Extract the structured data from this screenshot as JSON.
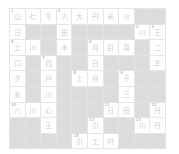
{
  "puzzle": {
    "rows": 9,
    "cols": 10,
    "colors": {
      "block": "#dcdcdc",
      "cell": "#ffffff",
      "grid_line": "#e6e6e6",
      "glyph": "#cfcfcf"
    },
    "grid": [
      [
        {
          "n": "1",
          "g": "山"
        },
        {
          "n": "",
          "g": "七"
        },
        {
          "n": "",
          "g": "平"
        },
        {
          "n": "2",
          "g": "人"
        },
        {
          "n": "",
          "g": "大"
        },
        {
          "n": "",
          "g": "円"
        },
        {
          "n": "",
          "g": "米"
        },
        {
          "n": "",
          "g": "火"
        },
        null,
        null
      ],
      [
        {
          "n": "",
          "g": "日"
        },
        null,
        null,
        {
          "n": "",
          "g": "田"
        },
        null,
        null,
        null,
        null,
        {
          "n": "3",
          "g": "川"
        },
        {
          "n": "4",
          "g": "王"
        }
      ],
      [
        {
          "n": "5",
          "g": "土"
        },
        {
          "n": "",
          "g": "川"
        },
        null,
        {
          "n": "",
          "g": "木"
        },
        null,
        {
          "n": "6",
          "g": "月"
        },
        {
          "n": "",
          "g": "目"
        },
        {
          "n": "",
          "g": "耳"
        },
        null,
        {
          "n": "",
          "g": "二"
        }
      ],
      [
        {
          "n": "",
          "g": "口"
        },
        null,
        {
          "n": "7",
          "g": "四"
        },
        null,
        null,
        {
          "n": "",
          "g": "日"
        },
        null,
        null,
        null,
        {
          "n": "",
          "g": "羊"
        }
      ],
      [
        {
          "n": "",
          "g": "夕"
        },
        null,
        {
          "n": "",
          "g": "戸"
        },
        null,
        {
          "n": "8",
          "g": "上"
        },
        {
          "n": "",
          "g": "目"
        },
        null,
        {
          "n": "9",
          "g": "子"
        },
        null,
        null
      ],
      [
        {
          "n": "",
          "g": "女"
        },
        null,
        {
          "n": "",
          "g": "川"
        },
        null,
        null,
        null,
        null,
        {
          "n": "",
          "g": "三"
        },
        null,
        null
      ],
      [
        {
          "n": "10",
          "g": "八"
        },
        {
          "n": "",
          "g": "川"
        },
        {
          "n": "",
          "g": "心"
        },
        null,
        null,
        null,
        {
          "n": "11",
          "g": "日"
        },
        {
          "n": "",
          "g": "田"
        },
        null,
        {
          "n": "12",
          "g": "丹"
        }
      ],
      [
        null,
        null,
        {
          "n": "",
          "g": "王"
        },
        null,
        null,
        {
          "n": "13",
          "g": "引"
        },
        null,
        null,
        {
          "n": "14",
          "g": "川"
        },
        {
          "n": "",
          "g": "丹"
        }
      ],
      [
        null,
        null,
        null,
        null,
        {
          "n": "15",
          "g": "引"
        },
        {
          "n": "",
          "g": "工"
        },
        {
          "n": "",
          "g": "村"
        },
        null,
        null,
        null
      ]
    ]
  }
}
